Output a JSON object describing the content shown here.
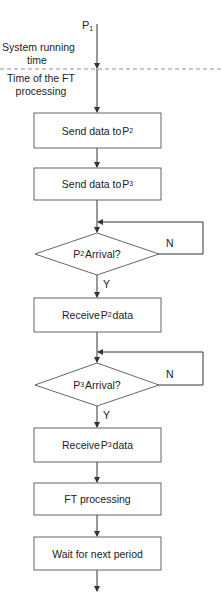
{
  "diagram": {
    "type": "flowchart",
    "start_label": {
      "main": "P",
      "sub": "1"
    },
    "regions": {
      "upper": "System running time",
      "upper_line1": "System running",
      "upper_line2": "time",
      "lower": "Time of the FT processing",
      "lower_line1": "Time of the FT",
      "lower_line2": "processing"
    },
    "steps": [
      {
        "id": "send-p2",
        "kind": "process",
        "text": "Send data to ",
        "p": "P",
        "sub": "2",
        "tail": ""
      },
      {
        "id": "send-p3",
        "kind": "process",
        "text": "Send data to ",
        "p": "P",
        "sub": "3",
        "tail": ""
      },
      {
        "id": "p2-arrival",
        "kind": "decision",
        "text": "",
        "p": "P",
        "sub": "2",
        "tail": "Arrival?",
        "no_label": "N",
        "yes_label": "Y"
      },
      {
        "id": "receive-p2",
        "kind": "process",
        "text": "Receive ",
        "p": "P",
        "sub": "2",
        "tail": "data"
      },
      {
        "id": "p3-arrival",
        "kind": "decision",
        "text": "",
        "p": "P",
        "sub": "3",
        "tail": "Arrival?",
        "no_label": "N",
        "yes_label": "Y"
      },
      {
        "id": "receive-p3",
        "kind": "process",
        "text": "Receive ",
        "p": "P",
        "sub": "3",
        "tail": "data"
      },
      {
        "id": "ft-processing",
        "kind": "process",
        "text": "FT processing"
      },
      {
        "id": "wait",
        "kind": "process",
        "text": "Wait for next period"
      }
    ],
    "colors": {
      "line": "#333333",
      "dash": "#777777",
      "fill": "#ffffff"
    }
  }
}
